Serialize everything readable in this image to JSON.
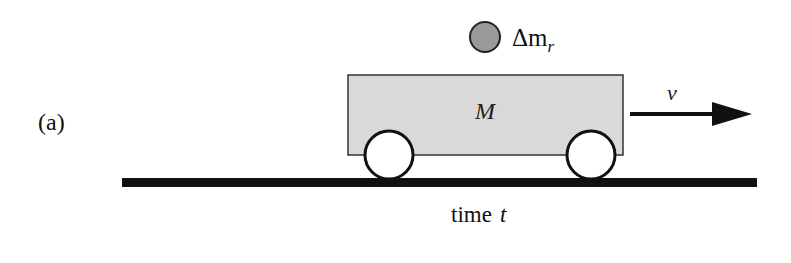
{
  "figure": {
    "panel_label": "(a)",
    "cart": {
      "mass_label": "M",
      "fill_color": "#d9d9d9",
      "stroke_color": "#333333"
    },
    "particle": {
      "label_prefix": "Δm",
      "label_subscript": "r",
      "fill_color": "#999999"
    },
    "velocity": {
      "label": "v"
    },
    "ground": {
      "color": "#111111"
    },
    "caption": {
      "text": "time",
      "variable": "t"
    }
  }
}
